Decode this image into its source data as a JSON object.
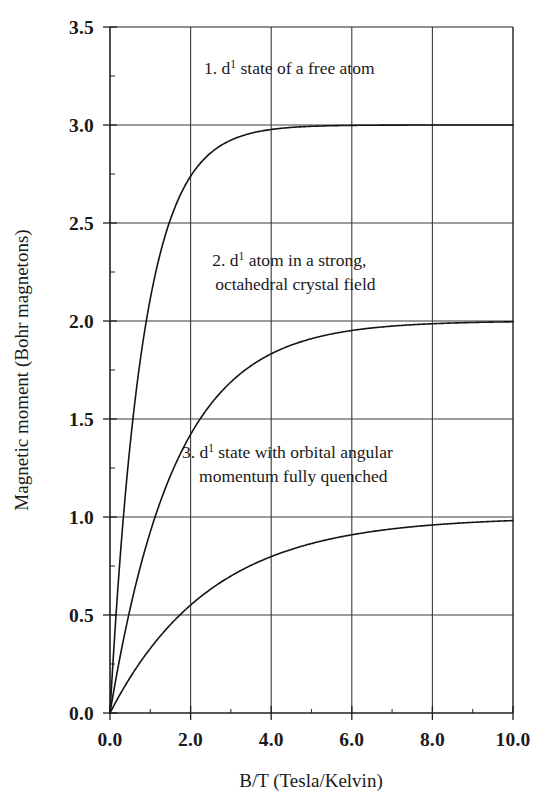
{
  "chart_data": {
    "type": "line",
    "title": "",
    "xlabel": "B/T (Tesla/Kelvin)",
    "ylabel": "Magnetic moment  (Bohr magnetons)",
    "xlim": [
      0.0,
      10.0
    ],
    "ylim": [
      0.0,
      3.5
    ],
    "grid": true,
    "legend_position": "inline-annotations",
    "x_ticks": [
      "0.0",
      "2.0",
      "4.0",
      "6.0",
      "8.0",
      "10.0"
    ],
    "x_tick_values": [
      0,
      2,
      4,
      6,
      8,
      10
    ],
    "x_minor_tick_values": [
      1,
      3,
      5,
      7,
      9
    ],
    "y_ticks": [
      "0.0",
      "0.5",
      "1.0",
      "1.5",
      "2.0",
      "2.5",
      "3.0",
      "3.5"
    ],
    "y_tick_values": [
      0.0,
      0.5,
      1.0,
      1.5,
      2.0,
      2.5,
      3.0,
      3.5
    ],
    "y_minor_tick_values": [
      0.25,
      0.75,
      1.25,
      1.75,
      2.25,
      2.75,
      3.25
    ],
    "series": [
      {
        "name": "1. d1 state of a free atom",
        "saturation": 3.0,
        "x": [
          0.0,
          0.1,
          0.2,
          0.3,
          0.5,
          0.7,
          0.9,
          1.1,
          1.3,
          1.5,
          1.7,
          2.0,
          2.3,
          2.6,
          3.0,
          3.4,
          3.8,
          4.2,
          4.6,
          5.0,
          5.5,
          6.0,
          6.5,
          7.0,
          7.5,
          8.0,
          8.5,
          9.0,
          9.5,
          10.0
        ],
        "values": [
          0.0,
          0.19,
          0.38,
          0.56,
          0.92,
          1.26,
          1.57,
          1.85,
          2.09,
          2.29,
          2.44,
          2.5,
          2.68,
          2.77,
          2.85,
          2.9,
          2.93,
          2.95,
          2.962,
          2.97,
          2.978,
          2.983,
          2.986,
          2.989,
          2.991,
          2.992,
          2.993,
          2.994,
          2.995,
          2.996
        ]
      },
      {
        "name": "2. d1 atom in a strong, octahedral crystal field",
        "saturation": 2.0,
        "x": [
          0.0,
          0.1,
          0.2,
          0.35,
          0.5,
          0.7,
          0.9,
          1.2,
          1.5,
          1.8,
          2.0,
          2.3,
          2.6,
          3.0,
          3.4,
          3.8,
          4.2,
          4.6,
          5.0,
          5.5,
          6.0,
          6.5,
          7.0,
          7.5,
          8.0,
          8.5,
          9.0,
          9.5,
          10.0
        ],
        "values": [
          0.0,
          0.12,
          0.24,
          0.41,
          0.57,
          0.76,
          0.94,
          1.18,
          1.38,
          1.53,
          1.5,
          1.72,
          1.8,
          1.87,
          1.91,
          1.94,
          1.955,
          1.965,
          1.972,
          1.978,
          1.982,
          1.985,
          1.987,
          1.989,
          1.99,
          1.991,
          1.992,
          1.993,
          1.994
        ]
      },
      {
        "name": "3. d1 state with orbital angular momentum fully quenched",
        "saturation": 1.0,
        "x": [
          0.0,
          0.1,
          0.2,
          0.35,
          0.5,
          0.7,
          0.9,
          1.2,
          1.5,
          1.8,
          2.1,
          2.4,
          2.7,
          3.0,
          3.3,
          3.6,
          4.0,
          4.4,
          4.8,
          5.2,
          5.6,
          6.0,
          6.5,
          7.0,
          7.5,
          8.0,
          8.5,
          9.0,
          9.5,
          10.0
        ],
        "values": [
          0.0,
          0.05,
          0.1,
          0.175,
          0.245,
          0.335,
          0.42,
          0.535,
          0.635,
          0.715,
          0.78,
          0.83,
          0.868,
          0.897,
          0.919,
          0.936,
          0.952,
          0.964,
          0.973,
          0.979,
          0.984,
          0.987,
          0.991,
          0.993,
          0.995,
          0.996,
          0.997,
          0.998,
          0.998,
          0.999
        ]
      }
    ],
    "annotations": [
      {
        "id": "annotation-1",
        "prefix": "1. d",
        "superscript": "1",
        "suffix": " state of a free atom",
        "line2": "",
        "x_data": 4.45,
        "y_data": 3.26
      },
      {
        "id": "annotation-2",
        "prefix": "2. d",
        "superscript": "1",
        "suffix": " atom in a strong,",
        "line2": "octahedral crystal field",
        "x_data": 4.45,
        "y_data": 2.28
      },
      {
        "id": "annotation-3",
        "prefix": "3. d",
        "superscript": "1",
        "suffix": " state with orbital angular",
        "line2": "momentum fully quenched",
        "x_data": 4.4,
        "y_data": 1.3
      }
    ],
    "colors": {
      "curve": "#151515",
      "grid": "#3a3a3a",
      "axis": "#1f1f1f",
      "background": "#ffffff",
      "text": "#1a1a1a"
    }
  }
}
